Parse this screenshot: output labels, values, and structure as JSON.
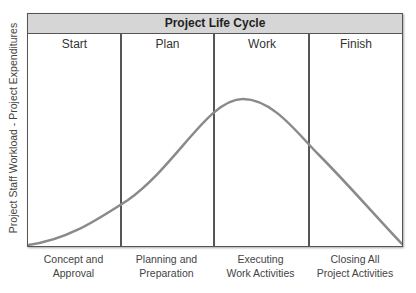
{
  "title": "Project Life Cycle",
  "y_axis_label": "Project Staff Workload - Project Expenditures",
  "phases": [
    {
      "name": "Start",
      "description_line1": "Concept and",
      "description_line2": "Approval"
    },
    {
      "name": "Plan",
      "description_line1": "Planning and",
      "description_line2": "Preparation"
    },
    {
      "name": "Work",
      "description_line1": "Executing",
      "description_line2": "Work Activities"
    },
    {
      "name": "Finish",
      "description_line1": "Closing All",
      "description_line2": "Project Activities"
    }
  ],
  "colors": {
    "header_bg": "#d6d6d6",
    "border": "#555555",
    "curve": "#8a8a8a"
  },
  "curve_shape": "rises slowly from Start, peaks mid-Work, declines to zero at end of Finish"
}
